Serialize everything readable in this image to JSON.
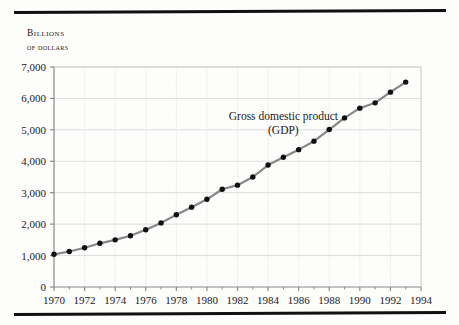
{
  "figure": {
    "y_axis_title_line1": "Billions",
    "y_axis_title_line2": "of dollars"
  },
  "chart_data": {
    "type": "line",
    "title": "",
    "subtitle": "",
    "xlabel": "",
    "ylabel": "Billions of dollars",
    "annotation": "Gross domestic product",
    "annotation_line2": "(GDP)",
    "series_name": "Gross domestic product (GDP)",
    "line_color": "#878787",
    "marker_color": "#101010",
    "grid": true,
    "grid_color": "#d9d9d9",
    "legend_position": "inline-annotation",
    "xlim": [
      1970,
      1994
    ],
    "ylim": [
      0,
      7000
    ],
    "xticks": [
      1970,
      1972,
      1974,
      1976,
      1978,
      1980,
      1982,
      1984,
      1986,
      1988,
      1990,
      1992,
      1994
    ],
    "xtick_labels": [
      "1970",
      "1972",
      "1974",
      "1976",
      "1978",
      "1980",
      "1982",
      "1984",
      "1986",
      "1988",
      "1990",
      "1992",
      "1994"
    ],
    "yticks": [
      0,
      1000,
      2000,
      3000,
      4000,
      5000,
      6000,
      7000
    ],
    "ytick_labels": [
      "0",
      "1,000",
      "2,000",
      "3,000",
      "4,000",
      "5,000",
      "6,000",
      "7,000"
    ],
    "x": [
      1970,
      1971,
      1972,
      1973,
      1974,
      1975,
      1976,
      1977,
      1978,
      1979,
      1980,
      1981,
      1982,
      1983,
      1984,
      1985,
      1986,
      1987,
      1988,
      1989,
      1990,
      1991,
      1992,
      1993
    ],
    "values": [
      1040,
      1130,
      1250,
      1390,
      1500,
      1630,
      1820,
      2040,
      2300,
      2540,
      2790,
      3110,
      3240,
      3500,
      3880,
      4130,
      4370,
      4640,
      5010,
      5380,
      5690,
      5860,
      6200,
      6520
    ]
  }
}
